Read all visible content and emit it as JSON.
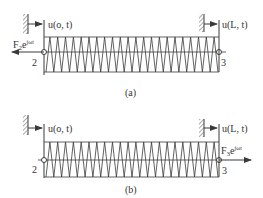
{
  "figure": {
    "colors": {
      "line": "#3a3a3a",
      "background": "#ffffff",
      "text": "#333333"
    },
    "panels": [
      {
        "id": "a",
        "caption": "(a)",
        "left_displacement": "u(o, t)",
        "right_displacement": "u(L, t)",
        "left_node": "2",
        "right_node": "3",
        "force": {
          "base": "F",
          "sub": "2",
          "e": "e",
          "exp": "jωt",
          "side": "left",
          "direction": "left"
        }
      },
      {
        "id": "b",
        "caption": "(b)",
        "left_displacement": "u(o, t)",
        "right_displacement": "u(L, t)",
        "left_node": "2",
        "right_node": "3",
        "force": {
          "base": "F",
          "sub": "3",
          "e": "e",
          "exp": "jωt",
          "side": "right",
          "direction": "right"
        }
      }
    ]
  }
}
